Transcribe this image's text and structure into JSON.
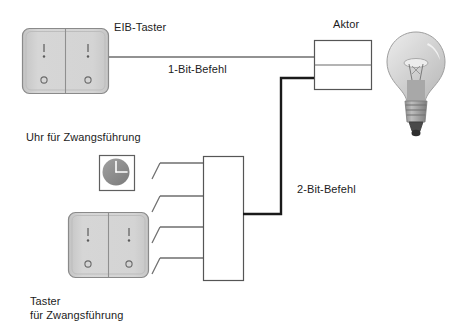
{
  "diagram": {
    "labels": {
      "eib_taster": "EIB-Taster",
      "one_bit_command": "1-Bit-Befehl",
      "aktor": "Aktor",
      "clock_forced": "Uhr für Zwangsführung",
      "two_bit_command": "2-Bit-Befehl",
      "push_button_forced_line1": "Taster",
      "push_button_forced_line2": "für Zwangsführung"
    },
    "colors": {
      "background": "#ffffff",
      "text": "#1c1c1c",
      "wire_thin": "#6e6e6e",
      "wire_thick": "#1a1a1a",
      "box_stroke": "#555555",
      "switch_face": "#d2d2d2",
      "switch_face_edge": "#c0c0c0",
      "switch_stroke": "#8a8a8a",
      "clock_dial": "#8c8c8c",
      "clock_hands": "#ffffff",
      "bulb_glass": "#d8d8d8",
      "bulb_base": "#9a9a9a",
      "bulb_tip": "#3a3a3a",
      "filament": "#7a7a7a"
    },
    "components": {
      "eib_taster_switch": {
        "name": "EIB-Taster rocker switch",
        "type": "two-gang-rocker",
        "symbols_top": [
          "I",
          "·"
        ],
        "symbols_bottom": [
          "o",
          "o"
        ],
        "rect": {
          "x": 22,
          "y": 28,
          "w": 87,
          "h": 66
        }
      },
      "aktor_box": {
        "name": "Aktor",
        "type": "two-channel-box",
        "rect": {
          "x": 314,
          "y": 40,
          "w": 58,
          "h": 50
        },
        "divider_y": 65
      },
      "lamp": {
        "name": "Gluehlampe",
        "type": "incandescent-bulb",
        "rect": {
          "x": 385,
          "y": 30,
          "w": 62,
          "h": 112
        }
      },
      "clock": {
        "name": "Uhr",
        "type": "clock-icon",
        "rect": {
          "x": 99,
          "y": 155,
          "w": 36,
          "h": 36
        },
        "hands": [
          "12",
          "3"
        ]
      },
      "taster_zwang_switch": {
        "name": "Taster fuer Zwangsfuehrung",
        "type": "two-gang-rocker",
        "symbols_top": [
          "I",
          "·"
        ],
        "symbols_bottom": [
          "o",
          "o"
        ],
        "rect": {
          "x": 68,
          "y": 212,
          "w": 81,
          "h": 66
        }
      },
      "logic_box": {
        "name": "Logik-/Zwangsfuehrungsbaustein",
        "type": "blank-rectangle",
        "rect": {
          "x": 203,
          "y": 156,
          "w": 40,
          "h": 125
        }
      },
      "contacts": {
        "name": "Schaltkontakte",
        "count": 4,
        "line_y": [
          163,
          196,
          227,
          258
        ]
      }
    },
    "wires": [
      {
        "id": "wire-1bit",
        "from": "eib_taster_switch",
        "to": "aktor_box.top_channel",
        "style": "thin",
        "label": "1-Bit-Befehl",
        "points": "109,57 314,57"
      },
      {
        "id": "wire-2bit",
        "from": "logic_box",
        "to": "aktor_box.bottom_channel",
        "style": "thick",
        "label": "2-Bit-Befehl",
        "points": "243,214 281,214 281,78 314,78"
      }
    ]
  }
}
